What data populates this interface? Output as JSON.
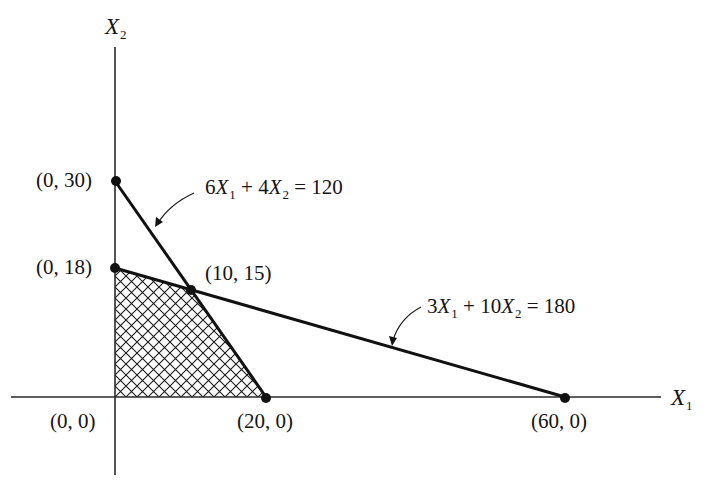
{
  "figure": {
    "type": "linear-programming-feasible-region",
    "axes": {
      "x_label": "X",
      "x_label_sub": "1",
      "y_label": "X",
      "y_label_sub": "2"
    },
    "constraints": [
      {
        "id": "c1",
        "coef_x1": "6",
        "coef_x2": "4",
        "rhs": "120",
        "label_parts": [
          "6",
          "X",
          "1",
          " + 4",
          "X",
          "2",
          " = 120"
        ],
        "intercepts": [
          [
            0,
            30
          ],
          [
            20,
            0
          ]
        ]
      },
      {
        "id": "c2",
        "coef_x1": "3",
        "coef_x2": "10",
        "rhs": "180",
        "label_parts": [
          "3",
          "X",
          "1",
          " + 10",
          "X",
          "2",
          " = 180"
        ],
        "intercepts": [
          [
            0,
            18
          ],
          [
            60,
            0
          ]
        ]
      }
    ],
    "points": [
      {
        "label": "(0, 30)",
        "x": 0,
        "y": 30
      },
      {
        "label": "(0, 18)",
        "x": 0,
        "y": 18
      },
      {
        "label": "(10, 15)",
        "x": 10,
        "y": 15
      },
      {
        "label": "(0, 0)",
        "x": 0,
        "y": 0
      },
      {
        "label": "(20, 0)",
        "x": 20,
        "y": 0
      },
      {
        "label": "(60, 0)",
        "x": 60,
        "y": 0
      }
    ],
    "feasible_region": {
      "vertices": [
        [
          0,
          0
        ],
        [
          0,
          18
        ],
        [
          10,
          15
        ],
        [
          20,
          0
        ]
      ],
      "fill": "crosshatch"
    },
    "colors": {
      "line": "#111111",
      "axis": "#2a2a2a",
      "hatch": "#1a1a1a",
      "background": "#ffffff"
    }
  }
}
